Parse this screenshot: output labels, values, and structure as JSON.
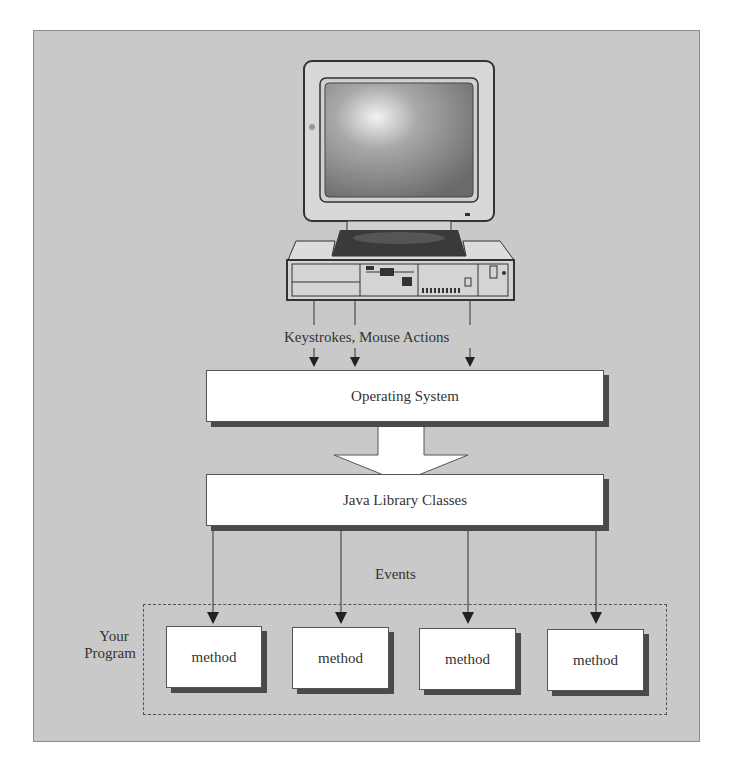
{
  "diagram": {
    "computer": {
      "icon": "desktop-computer-icon"
    },
    "input_label": "Keystrokes, Mouse Actions",
    "layers": [
      {
        "id": "os",
        "label": "Operating System"
      },
      {
        "id": "java",
        "label": "Java Library Classes"
      }
    ],
    "events_label": "Events",
    "program": {
      "label_line1": "Your",
      "label_line2": "Program",
      "methods": [
        "method",
        "method",
        "method",
        "method"
      ]
    },
    "colors": {
      "background": "#c9c9c9",
      "box_fill": "#ffffff",
      "shadow": "#4a4a4a",
      "line": "#333333"
    }
  }
}
